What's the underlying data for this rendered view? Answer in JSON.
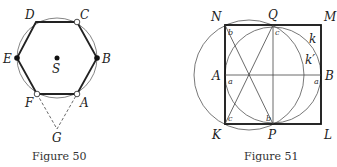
{
  "figure50": {
    "caption": "Figure 50",
    "labels": {
      "D": "D",
      "C": "C",
      "E": "E",
      "B": "B",
      "S": "S",
      "F": "F",
      "A": "A",
      "G": "G"
    }
  },
  "figure51": {
    "caption": "Figure 51",
    "labels": {
      "N": "N",
      "Q": "Q",
      "M": "M",
      "A": "A",
      "B": "B",
      "K": "K",
      "P": "P",
      "L": "L",
      "k": "k",
      "kprime": "k′"
    },
    "angle_labels": {
      "b1": "b",
      "c1": "c",
      "a1": "a",
      "a2": "a",
      "c2": "c",
      "b2": "b"
    }
  }
}
